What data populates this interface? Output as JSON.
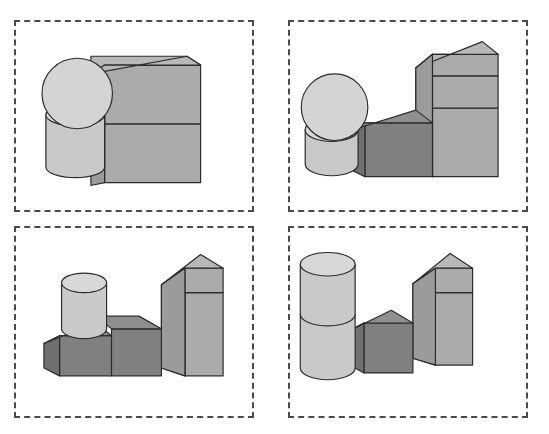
{
  "canvas": {
    "width": 549,
    "height": 434,
    "background": "#ffffff"
  },
  "style": {
    "panel_border_color": "#4a4a4a",
    "panel_border_style": "dashed",
    "panel_border_width": 2,
    "outline_color": "#2b2b2b",
    "seam_color": "#9a9a9a",
    "palette": {
      "light_top": "#dcdcdc",
      "light_front": "#c9c9c9",
      "light_side": "#b3b3b3",
      "mid_top": "#b8b8b8",
      "mid_front": "#ababab",
      "mid_side": "#9b9b9b",
      "dark_top": "#8f8f8f",
      "dark_front": "#808080",
      "dark_side": "#707070",
      "sphere_fill": "#d4d4d4",
      "cylinder_fill": "#c9c9c9",
      "cylinder_top": "#d8d8d8"
    }
  },
  "layout": {
    "rows": 2,
    "cols": 2,
    "panel_count": 4,
    "panels": [
      {
        "name": "panel-top-left",
        "x": 14,
        "y": 20,
        "width": 240,
        "height": 192
      },
      {
        "name": "panel-top-right",
        "x": 288,
        "y": 20,
        "width": 240,
        "height": 192
      },
      {
        "name": "panel-bottom-left",
        "x": 14,
        "y": 226,
        "width": 240,
        "height": 192
      },
      {
        "name": "panel-bottom-right",
        "x": 288,
        "y": 226,
        "width": 240,
        "height": 192
      }
    ]
  },
  "scene_data": {
    "type": "3d-block-scenes",
    "description": "Four dashed-outline panels, each containing an isometric arrangement of gray geometric primitives: spheres, cylinders and cuboids resting on an implied ground plane.",
    "panels": [
      {
        "id": 1,
        "label": "panel-top-left",
        "objects": [
          {
            "name": "sphere",
            "shape": "sphere",
            "shade": "light",
            "position": "left-upper",
            "stacked_on": "cylinder"
          },
          {
            "name": "cylinder",
            "shape": "cylinder",
            "shade": "light",
            "position": "left-lower",
            "on_ground": true
          },
          {
            "name": "box-lower",
            "shape": "cuboid",
            "shade": "mid",
            "position": "right-lower",
            "on_ground": true,
            "size": "wide"
          },
          {
            "name": "box-upper",
            "shape": "cuboid",
            "shade": "mid",
            "position": "right-upper",
            "stacked_on": "box-lower",
            "size": "wide"
          }
        ],
        "object_count": 4
      },
      {
        "id": 2,
        "label": "panel-top-right",
        "objects": [
          {
            "name": "sphere",
            "shape": "sphere",
            "shade": "light",
            "position": "left-upper",
            "stacked_on": "cylinder"
          },
          {
            "name": "cylinder",
            "shape": "cylinder",
            "shade": "light",
            "position": "left-lower",
            "on_ground": true
          },
          {
            "name": "cube-dark",
            "shape": "cuboid",
            "shade": "dark",
            "position": "middle",
            "on_ground": true
          },
          {
            "name": "box-tall-lower",
            "shape": "cuboid",
            "shade": "mid",
            "position": "right-lower",
            "on_ground": true
          },
          {
            "name": "box-tall-upper",
            "shape": "cuboid",
            "shade": "mid",
            "position": "right-upper",
            "stacked_on": "box-tall-lower"
          }
        ],
        "object_count": 5
      },
      {
        "id": 3,
        "label": "panel-bottom-left",
        "objects": [
          {
            "name": "cylinder",
            "shape": "cylinder",
            "shade": "light",
            "position": "left-upper",
            "stacked_on": "cube-dark-left"
          },
          {
            "name": "cube-dark-left",
            "shape": "cuboid",
            "shade": "dark",
            "position": "left-lower",
            "on_ground": true
          },
          {
            "name": "cube-dark-middle",
            "shape": "cuboid",
            "shade": "dark",
            "position": "middle",
            "on_ground": true
          },
          {
            "name": "box-tall-lower",
            "shape": "cuboid",
            "shade": "mid",
            "position": "right-lower",
            "on_ground": true
          },
          {
            "name": "box-tall-upper",
            "shape": "cuboid",
            "shade": "mid",
            "position": "right-upper",
            "stacked_on": "box-tall-lower"
          }
        ],
        "object_count": 5
      },
      {
        "id": 4,
        "label": "panel-bottom-right",
        "objects": [
          {
            "name": "cylinder-upper",
            "shape": "cylinder",
            "shade": "light",
            "position": "left-upper",
            "stacked_on": "cylinder-lower"
          },
          {
            "name": "cylinder-lower",
            "shape": "cylinder",
            "shade": "light",
            "position": "left-lower",
            "on_ground": true
          },
          {
            "name": "cube-dark",
            "shape": "cuboid",
            "shade": "dark",
            "position": "middle",
            "on_ground": true
          },
          {
            "name": "box-tall-lower",
            "shape": "cuboid",
            "shade": "mid",
            "position": "right-lower",
            "on_ground": true
          },
          {
            "name": "box-tall-upper",
            "shape": "cuboid",
            "shade": "mid",
            "position": "right-upper",
            "stacked_on": "box-tall-lower"
          }
        ],
        "object_count": 5
      }
    ]
  }
}
